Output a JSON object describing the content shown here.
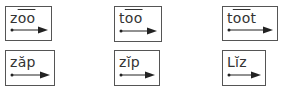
{
  "cards": [
    {
      "id": "zoo",
      "plain_before": "z",
      "marked": "oo",
      "mark": "macron",
      "plain_after": "",
      "display": "zo͞o",
      "x": 5,
      "y": 6,
      "w": 47,
      "h": 35
    },
    {
      "id": "too",
      "plain_before": "t",
      "marked": "oo",
      "mark": "macron",
      "plain_after": "",
      "display": "to͞o",
      "x": 114,
      "y": 6,
      "w": 48,
      "h": 36
    },
    {
      "id": "toot",
      "plain_before": "t",
      "marked": "oo",
      "mark": "macron",
      "plain_after": "t",
      "display": "to͞ot",
      "x": 222,
      "y": 6,
      "w": 56,
      "h": 35
    },
    {
      "id": "zap",
      "plain_before": "z",
      "marked": "ă",
      "mark": "breve",
      "plain_after": "p",
      "display": "zăp",
      "x": 5,
      "y": 50,
      "w": 50,
      "h": 36
    },
    {
      "id": "zip",
      "plain_before": "z",
      "marked": "ĭ",
      "mark": "breve",
      "plain_after": "p",
      "display": "zĭp",
      "x": 114,
      "y": 50,
      "w": 46,
      "h": 36
    },
    {
      "id": "liz",
      "plain_before": "L",
      "marked": "ĭ",
      "mark": "breve",
      "plain_after": "z",
      "display": "Lĭz",
      "x": 222,
      "y": 50,
      "w": 44,
      "h": 36
    }
  ],
  "arrow": {
    "style": "dot-start-arrow-end",
    "color": "#222222"
  }
}
